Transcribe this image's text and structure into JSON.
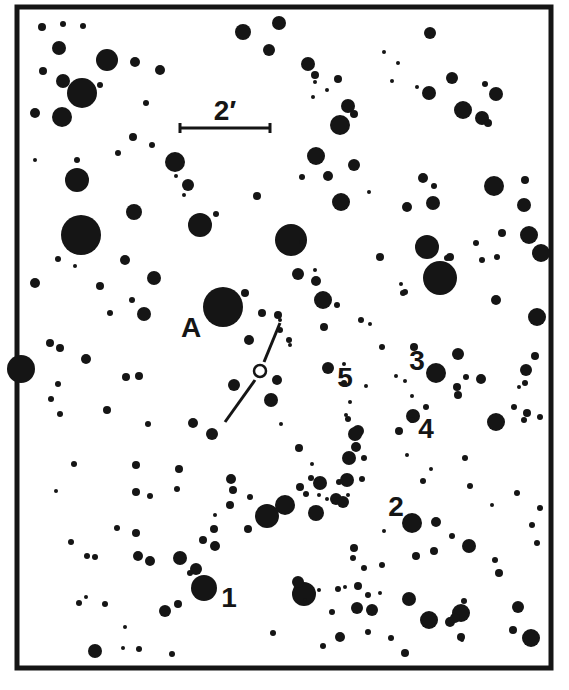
{
  "frame": {
    "x": 17,
    "y": 7,
    "w": 534,
    "h": 661,
    "stroke": 5,
    "color": "#151515"
  },
  "scale_bar": {
    "label": "2′",
    "x1": 180,
    "x2": 270,
    "y": 128,
    "label_x": 225,
    "label_y": 120
  },
  "labels": [
    {
      "id": "A",
      "text": "A",
      "x": 191,
      "y": 337
    },
    {
      "id": "1",
      "text": "1",
      "x": 229,
      "y": 607
    },
    {
      "id": "2",
      "text": "2",
      "x": 396,
      "y": 516
    },
    {
      "id": "3",
      "text": "3",
      "x": 417,
      "y": 370
    },
    {
      "id": "4",
      "text": "4",
      "x": 426,
      "y": 438
    },
    {
      "id": "5",
      "text": "5",
      "x": 345,
      "y": 387
    }
  ],
  "target": {
    "x": 260,
    "y": 371,
    "r": 6
  },
  "target_lines": [
    {
      "x1": 280,
      "y1": 323,
      "x2": 264,
      "y2": 362
    },
    {
      "x1": 255,
      "y1": 380,
      "x2": 225,
      "y2": 422
    }
  ],
  "stars": [
    [
      42,
      27,
      4
    ],
    [
      63,
      24,
      3
    ],
    [
      83,
      26,
      3
    ],
    [
      59,
      48,
      7
    ],
    [
      107,
      60,
      11
    ],
    [
      135,
      62,
      5
    ],
    [
      160,
      70,
      5
    ],
    [
      43,
      71,
      4
    ],
    [
      63,
      81,
      7
    ],
    [
      82,
      93,
      15
    ],
    [
      100,
      85,
      3
    ],
    [
      35,
      113,
      5
    ],
    [
      62,
      117,
      10
    ],
    [
      146,
      103,
      3
    ],
    [
      133,
      137,
      4
    ],
    [
      118,
      153,
      3
    ],
    [
      152,
      145,
      3
    ],
    [
      77,
      160,
      3
    ],
    [
      35,
      160,
      2
    ],
    [
      175,
      162,
      10
    ],
    [
      188,
      185,
      6
    ],
    [
      176,
      176,
      2
    ],
    [
      184,
      195,
      2
    ],
    [
      257,
      196,
      4
    ],
    [
      200,
      225,
      12
    ],
    [
      216,
      214,
      3
    ],
    [
      134,
      212,
      8
    ],
    [
      77,
      180,
      12
    ],
    [
      81,
      235,
      20
    ],
    [
      243,
      32,
      8
    ],
    [
      279,
      23,
      7
    ],
    [
      269,
      50,
      6
    ],
    [
      308,
      64,
      7
    ],
    [
      315,
      75,
      4
    ],
    [
      338,
      79,
      4
    ],
    [
      384,
      52,
      2
    ],
    [
      398,
      63,
      2
    ],
    [
      430,
      33,
      6
    ],
    [
      429,
      93,
      7
    ],
    [
      452,
      78,
      6
    ],
    [
      348,
      106,
      7
    ],
    [
      354,
      114,
      4
    ],
    [
      340,
      125,
      10
    ],
    [
      316,
      156,
      9
    ],
    [
      354,
      165,
      6
    ],
    [
      315,
      82,
      2
    ],
    [
      327,
      90,
      2
    ],
    [
      313,
      97,
      2
    ],
    [
      392,
      81,
      2
    ],
    [
      417,
      87,
      2
    ],
    [
      485,
      84,
      3
    ],
    [
      463,
      110,
      9
    ],
    [
      496,
      94,
      7
    ],
    [
      482,
      118,
      7
    ],
    [
      488,
      123,
      4
    ],
    [
      302,
      177,
      3
    ],
    [
      328,
      176,
      5
    ],
    [
      341,
      202,
      9
    ],
    [
      369,
      192,
      2
    ],
    [
      407,
      207,
      5
    ],
    [
      433,
      203,
      7
    ],
    [
      423,
      178,
      5
    ],
    [
      434,
      186,
      3
    ],
    [
      380,
      257,
      4
    ],
    [
      447,
      258,
      3
    ],
    [
      482,
      260,
      3
    ],
    [
      494,
      186,
      10
    ],
    [
      502,
      233,
      4
    ],
    [
      524,
      205,
      7
    ],
    [
      525,
      180,
      4
    ],
    [
      529,
      235,
      9
    ],
    [
      291,
      240,
      16
    ],
    [
      280,
      330,
      3
    ],
    [
      301,
      242,
      2
    ],
    [
      298,
      274,
      6
    ],
    [
      316,
      281,
      5
    ],
    [
      323,
      300,
      9
    ],
    [
      337,
      305,
      3
    ],
    [
      324,
      327,
      4
    ],
    [
      280,
      320,
      2
    ],
    [
      315,
      270,
      2
    ],
    [
      401,
      284,
      2
    ],
    [
      361,
      320,
      3
    ],
    [
      432,
      271,
      3
    ],
    [
      405,
      292,
      3
    ],
    [
      403,
      293,
      3
    ],
    [
      440,
      278,
      17
    ],
    [
      427,
      247,
      12
    ],
    [
      450,
      257,
      4
    ],
    [
      476,
      243,
      3
    ],
    [
      497,
      257,
      3
    ],
    [
      537,
      317,
      9
    ],
    [
      535,
      356,
      4
    ],
    [
      526,
      370,
      6
    ],
    [
      525,
      383,
      3
    ],
    [
      519,
      387,
      2
    ],
    [
      541,
      253,
      9
    ],
    [
      496,
      300,
      5
    ],
    [
      21,
      369,
      14
    ],
    [
      58,
      259,
      3
    ],
    [
      75,
      266,
      2
    ],
    [
      125,
      260,
      5
    ],
    [
      154,
      278,
      7
    ],
    [
      35,
      283,
      5
    ],
    [
      100,
      286,
      4
    ],
    [
      110,
      313,
      3
    ],
    [
      132,
      300,
      3
    ],
    [
      144,
      314,
      7
    ],
    [
      223,
      307,
      20
    ],
    [
      245,
      293,
      4
    ],
    [
      262,
      313,
      4
    ],
    [
      278,
      315,
      4
    ],
    [
      249,
      340,
      5
    ],
    [
      50,
      343,
      4
    ],
    [
      60,
      348,
      4
    ],
    [
      86,
      359,
      5
    ],
    [
      58,
      384,
      3
    ],
    [
      51,
      399,
      3
    ],
    [
      60,
      414,
      3
    ],
    [
      126,
      377,
      4
    ],
    [
      107,
      410,
      4
    ],
    [
      139,
      376,
      4
    ],
    [
      148,
      424,
      3
    ],
    [
      193,
      423,
      5
    ],
    [
      212,
      434,
      6
    ],
    [
      234,
      385,
      6
    ],
    [
      277,
      380,
      5
    ],
    [
      271,
      400,
      7
    ],
    [
      290,
      345,
      2
    ],
    [
      289,
      340,
      3
    ],
    [
      328,
      368,
      6
    ],
    [
      344,
      383,
      3
    ],
    [
      344,
      364,
      2
    ],
    [
      366,
      386,
      2
    ],
    [
      370,
      324,
      2
    ],
    [
      382,
      347,
      3
    ],
    [
      414,
      347,
      4
    ],
    [
      436,
      373,
      10
    ],
    [
      458,
      354,
      6
    ],
    [
      457,
      387,
      4
    ],
    [
      481,
      379,
      5
    ],
    [
      466,
      377,
      3
    ],
    [
      458,
      395,
      4
    ],
    [
      396,
      376,
      2
    ],
    [
      405,
      381,
      2
    ],
    [
      350,
      402,
      2
    ],
    [
      346,
      415,
      2
    ],
    [
      348,
      419,
      3
    ],
    [
      413,
      416,
      7
    ],
    [
      412,
      420,
      3
    ],
    [
      399,
      431,
      4
    ],
    [
      358,
      431,
      6
    ],
    [
      356,
      447,
      5
    ],
    [
      364,
      458,
      3
    ],
    [
      412,
      396,
      2
    ],
    [
      426,
      407,
      3
    ],
    [
      496,
      422,
      9
    ],
    [
      514,
      407,
      3
    ],
    [
      527,
      413,
      4
    ],
    [
      540,
      417,
      3
    ],
    [
      524,
      420,
      3
    ],
    [
      348,
      495,
      2
    ],
    [
      339,
      482,
      3
    ],
    [
      327,
      499,
      2
    ],
    [
      316,
      513,
      8
    ],
    [
      336,
      499,
      6
    ],
    [
      285,
      505,
      10
    ],
    [
      267,
      516,
      12
    ],
    [
      250,
      497,
      3
    ],
    [
      299,
      448,
      4
    ],
    [
      281,
      424,
      2
    ],
    [
      312,
      464,
      2
    ],
    [
      320,
      483,
      7
    ],
    [
      311,
      478,
      3
    ],
    [
      300,
      487,
      4
    ],
    [
      306,
      494,
      3
    ],
    [
      231,
      479,
      5
    ],
    [
      74,
      464,
      3
    ],
    [
      56,
      491,
      2
    ],
    [
      136,
      492,
      4
    ],
    [
      150,
      496,
      3
    ],
    [
      177,
      489,
      3
    ],
    [
      179,
      469,
      4
    ],
    [
      136,
      465,
      4
    ],
    [
      230,
      505,
      4
    ],
    [
      319,
      495,
      2
    ],
    [
      343,
      502,
      6
    ],
    [
      349,
      458,
      7
    ],
    [
      355,
      434,
      7
    ],
    [
      347,
      480,
      7
    ],
    [
      362,
      479,
      3
    ],
    [
      423,
      481,
      3
    ],
    [
      465,
      458,
      3
    ],
    [
      470,
      486,
      3
    ],
    [
      492,
      505,
      2
    ],
    [
      517,
      493,
      3
    ],
    [
      540,
      508,
      3
    ],
    [
      532,
      525,
      3
    ],
    [
      537,
      543,
      3
    ],
    [
      412,
      523,
      10
    ],
    [
      436,
      522,
      5
    ],
    [
      384,
      531,
      2
    ],
    [
      469,
      546,
      7
    ],
    [
      354,
      548,
      4
    ],
    [
      353,
      558,
      3
    ],
    [
      416,
      556,
      4
    ],
    [
      434,
      551,
      4
    ],
    [
      499,
      573,
      4
    ],
    [
      452,
      536,
      3
    ],
    [
      407,
      455,
      2
    ],
    [
      431,
      469,
      2
    ],
    [
      71,
      542,
      3
    ],
    [
      87,
      556,
      3
    ],
    [
      95,
      557,
      3
    ],
    [
      79,
      603,
      3
    ],
    [
      86,
      597,
      2
    ],
    [
      105,
      604,
      3
    ],
    [
      117,
      528,
      3
    ],
    [
      136,
      533,
      4
    ],
    [
      138,
      556,
      5
    ],
    [
      150,
      561,
      5
    ],
    [
      180,
      558,
      7
    ],
    [
      196,
      569,
      6
    ],
    [
      203,
      540,
      4
    ],
    [
      215,
      546,
      5
    ],
    [
      214,
      529,
      4
    ],
    [
      204,
      588,
      13
    ],
    [
      178,
      604,
      4
    ],
    [
      165,
      611,
      6
    ],
    [
      190,
      573,
      3
    ],
    [
      215,
      515,
      2
    ],
    [
      125,
      627,
      2
    ],
    [
      123,
      648,
      2
    ],
    [
      139,
      649,
      3
    ],
    [
      172,
      654,
      3
    ],
    [
      95,
      651,
      7
    ],
    [
      233,
      490,
      4
    ],
    [
      248,
      529,
      4
    ],
    [
      273,
      633,
      3
    ],
    [
      304,
      594,
      12
    ],
    [
      305,
      600,
      2
    ],
    [
      323,
      646,
      3
    ],
    [
      332,
      612,
      3
    ],
    [
      357,
      608,
      6
    ],
    [
      372,
      610,
      6
    ],
    [
      368,
      595,
      3
    ],
    [
      340,
      637,
      5
    ],
    [
      368,
      632,
      3
    ],
    [
      345,
      587,
      2
    ],
    [
      338,
      589,
      3
    ],
    [
      358,
      586,
      4
    ],
    [
      319,
      590,
      2
    ],
    [
      380,
      593,
      2
    ],
    [
      391,
      638,
      3
    ],
    [
      461,
      613,
      9
    ],
    [
      429,
      620,
      9
    ],
    [
      495,
      560,
      3
    ],
    [
      518,
      607,
      6
    ],
    [
      531,
      638,
      9
    ],
    [
      513,
      630,
      4
    ],
    [
      450,
      622,
      5
    ],
    [
      461,
      637,
      4
    ],
    [
      462,
      640,
      2
    ],
    [
      405,
      653,
      4
    ],
    [
      464,
      601,
      3
    ],
    [
      298,
      582,
      6
    ],
    [
      364,
      568,
      3
    ],
    [
      382,
      565,
      3
    ],
    [
      409,
      599,
      7
    ],
    [
      455,
      618,
      5
    ]
  ]
}
